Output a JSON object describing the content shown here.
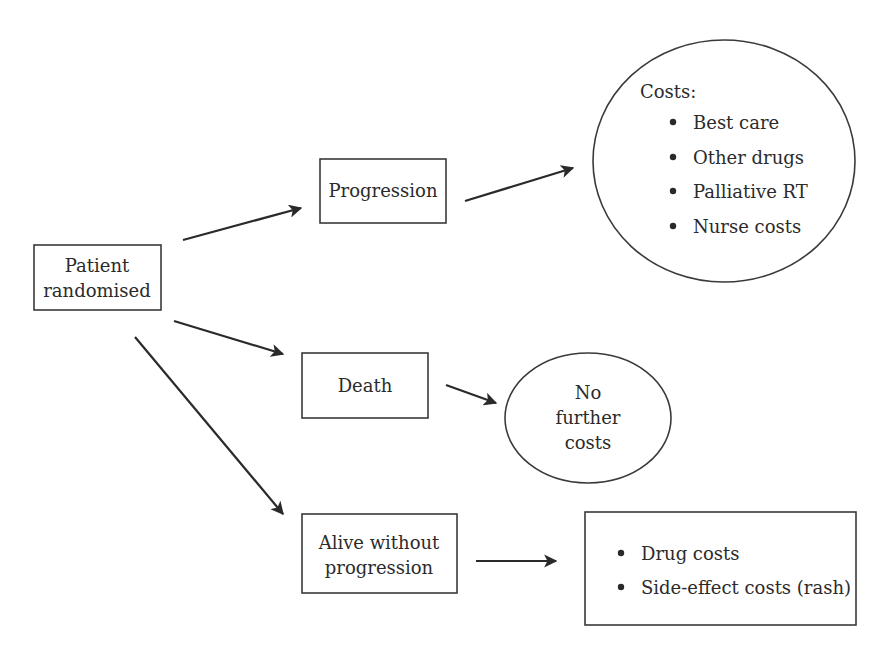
{
  "diagram": {
    "nodes": {
      "patient": {
        "lines": [
          "Patient",
          "randomised"
        ]
      },
      "progression": {
        "lines": [
          "Progression"
        ]
      },
      "death": {
        "lines": [
          "Death"
        ]
      },
      "alive": {
        "lines": [
          "Alive without",
          "progression"
        ]
      },
      "progression_costs": {
        "heading": "Costs:",
        "items": [
          "Best care",
          "Other drugs",
          "Palliative RT",
          "Nurse costs"
        ]
      },
      "death_costs": {
        "lines": [
          "No",
          "further",
          "costs"
        ]
      },
      "alive_costs": {
        "items": [
          "Drug costs",
          "Side-effect costs (rash)"
        ]
      }
    },
    "edges": [
      {
        "from": "patient",
        "to": "progression"
      },
      {
        "from": "patient",
        "to": "death"
      },
      {
        "from": "patient",
        "to": "alive"
      },
      {
        "from": "progression",
        "to": "progression_costs"
      },
      {
        "from": "death",
        "to": "death_costs"
      },
      {
        "from": "alive",
        "to": "alive_costs"
      }
    ],
    "colors": {
      "stroke": "#3a3a3a",
      "text": "#2b2b2b",
      "background": "#ffffff"
    }
  }
}
